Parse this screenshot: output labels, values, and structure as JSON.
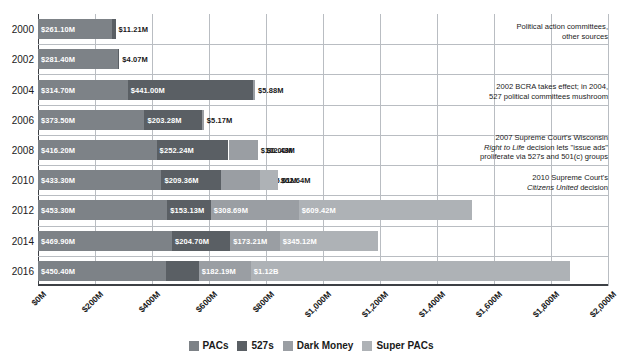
{
  "chart_data": {
    "type": "bar",
    "orientation": "horizontal",
    "stacked": true,
    "title": "",
    "subtitle": "",
    "xlabel": "",
    "ylabel": "",
    "xlim": [
      0,
      2000
    ],
    "xunit": "millions of dollars",
    "grid": "vertical",
    "legend_position": "bottom",
    "categories": [
      "2000",
      "2002",
      "2004",
      "2006",
      "2008",
      "2010",
      "2012",
      "2014",
      "2016"
    ],
    "series": [
      {
        "name": "PACs",
        "color": "#7d8287",
        "values": [
          261.1,
          281.4,
          314.7,
          373.5,
          416.2,
          433.3,
          453.3,
          469.9,
          450.4
        ],
        "labels": [
          "$261.10M",
          "$281.40M",
          "$314.70M",
          "$373.50M",
          "$416.20M",
          "$433.30M",
          "$453.30M",
          "$469.90M",
          "$450.40M"
        ]
      },
      {
        "name": "527s",
        "color": "#5a5f64",
        "values": [
          11.21,
          4.07,
          441.0,
          203.28,
          252.24,
          209.36,
          153.13,
          204.7,
          113.8
        ],
        "labels": [
          "$11.21M",
          "$4.07M",
          "$441.00M",
          "$203.28M",
          "$252.24M",
          "$209.36M",
          "$153.13M",
          "$204.70M",
          "$113.80M"
        ]
      },
      {
        "name": "Dark Money",
        "color": "#9a9ea3",
        "values": [
          0,
          0,
          5.88,
          5.17,
          102.43,
          135.61,
          308.69,
          173.21,
          182.19
        ],
        "labels": [
          "",
          "",
          "$5.88M",
          "$5.17M",
          "$102.43M",
          "$135.61M",
          "$308.69M",
          "$173.21M",
          "$182.19M"
        ]
      },
      {
        "name": "Super PACs",
        "color": "#aeb2b6",
        "values": [
          0,
          0,
          0,
          0,
          0.0,
          62.64,
          609.42,
          345.12,
          1120.0
        ],
        "labels": [
          "",
          "",
          "",
          "",
          "$0.00M",
          "$62.64M",
          "$609.42M",
          "$345.12M",
          "$1.12B"
        ]
      }
    ],
    "xticks": [
      "$0M",
      "$200M",
      "$400M",
      "$600M",
      "$800M",
      "$1,000M",
      "$1,200M",
      "$1,400M",
      "$1,600M",
      "$1,800M",
      "$2,000M"
    ],
    "xtick_values": [
      0,
      200,
      400,
      600,
      800,
      1000,
      1200,
      1400,
      1600,
      1800,
      2000
    ],
    "annotations": [
      {
        "row": "2000",
        "text": "Political action committees,\nother sources"
      },
      {
        "row": "2004",
        "text": "2002 BCRA takes effect; in 2004,\n527 political committees mushroom"
      },
      {
        "row": "2008",
        "text": "2007 Supreme Court's Wisconsin\nRight to Life decision lets \"issue ads\"\nproliferate via 527s and 501(c) groups"
      },
      {
        "row": "2010",
        "text": "2010 Supreme Court's\nCitizens United decision"
      }
    ]
  },
  "legend": {
    "items": [
      {
        "label": "PACs",
        "color": "#7d8287"
      },
      {
        "label": "527s",
        "color": "#5a5f64"
      },
      {
        "label": "Dark Money",
        "color": "#9a9ea3"
      },
      {
        "label": "Super PACs",
        "color": "#aeb2b6"
      }
    ]
  },
  "annotation_text": {
    "a0_line1": "Political action committees,",
    "a0_line2": "other sources",
    "a1_line1": "2002 BCRA takes effect; in 2004,",
    "a1_line2": "527 political committees mushroom",
    "a2_line1": "2007 Supreme Court's Wisconsin",
    "a2_line2_italic": "Right to Life",
    "a2_line2_rest": " decision lets \"issue ads\"",
    "a2_line3": "proliferate via 527s and 501(c) groups",
    "a3_line1": "2010 Supreme Court's",
    "a3_line2_italic": "Citizens United",
    "a3_line2_rest": " decision"
  }
}
